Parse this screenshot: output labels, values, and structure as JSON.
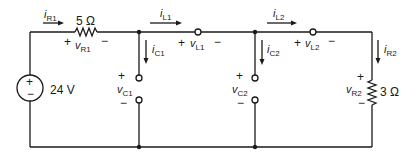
{
  "circuit": {
    "source": {
      "label": "24 V",
      "plus": "+",
      "minus": "−"
    },
    "r1": {
      "value": "5 Ω",
      "current_sym": "i",
      "current_sub": "R1",
      "voltage_sym": "v",
      "voltage_sub": "R1",
      "plus": "+",
      "minus": "−"
    },
    "l1": {
      "current_sym": "i",
      "current_sub": "L1",
      "voltage_sym": "v",
      "voltage_sub": "L1",
      "plus": "+",
      "minus": "−"
    },
    "c1": {
      "current_sym": "i",
      "current_sub": "C1",
      "voltage_sym": "v",
      "voltage_sub": "C1",
      "plus": "+",
      "minus": "−"
    },
    "l2": {
      "current_sym": "i",
      "current_sub": "L2",
      "voltage_sym": "v",
      "voltage_sub": "L2",
      "plus": "+",
      "minus": "−"
    },
    "c2": {
      "current_sym": "i",
      "current_sub": "C2",
      "voltage_sym": "v",
      "voltage_sub": "C2",
      "plus": "+",
      "minus": "−"
    },
    "r2": {
      "value": "3 Ω",
      "current_sym": "i",
      "current_sub": "R2",
      "voltage_sym": "v",
      "voltage_sub": "R2",
      "plus": "+",
      "minus": "−"
    }
  }
}
